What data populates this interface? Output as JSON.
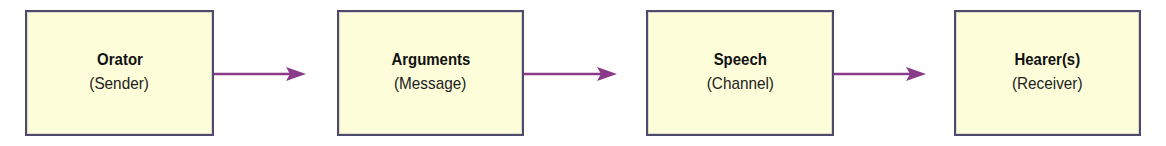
{
  "diagram": {
    "type": "flow",
    "direction": "left-to-right",
    "nodes": [
      {
        "title": "Orator",
        "subtitle": "(Sender)"
      },
      {
        "title": "Arguments",
        "subtitle": "(Message)"
      },
      {
        "title": "Speech",
        "subtitle": "(Channel)"
      },
      {
        "title": "Hearer(s)",
        "subtitle": "(Receiver)"
      }
    ],
    "edges": [
      {
        "from": "Orator",
        "to": "Arguments"
      },
      {
        "from": "Arguments",
        "to": "Speech"
      },
      {
        "from": "Speech",
        "to": "Hearer(s)"
      }
    ],
    "colors": {
      "box_fill": "#fdfdd9",
      "box_border": "#4d4a6e",
      "arrow": "#8b3a8a"
    }
  }
}
